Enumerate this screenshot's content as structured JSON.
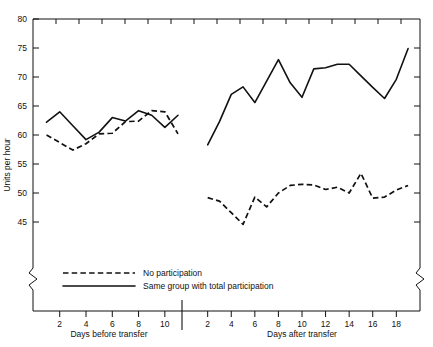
{
  "chart_data": {
    "type": "line",
    "title": "",
    "subtitle": "",
    "ylabel": "Units per hour",
    "ylim": [
      43,
      80
    ],
    "yticks": [
      45,
      50,
      55,
      60,
      65,
      70,
      75,
      80
    ],
    "grid": false,
    "legend_position": "inside-bottom-left",
    "axis_break": "y-axis broken below 45",
    "panels": [
      {
        "name": "before",
        "xlabel": "Days before transfer",
        "xticks": [
          2,
          4,
          6,
          8,
          10
        ],
        "xlim": [
          0.5,
          11
        ],
        "series": [
          {
            "name": "No participation",
            "style": "dashed",
            "x": [
              1,
              2,
              3,
              4,
              5,
              6,
              7,
              8,
              9,
              10,
              11
            ],
            "values": [
              60.0,
              58.7,
              57.4,
              58.5,
              60.2,
              60.3,
              62.3,
              62.4,
              64.2,
              64.0,
              60.2
            ]
          },
          {
            "name": "Same group with total participation",
            "style": "solid",
            "x": [
              1,
              2,
              3,
              4,
              5,
              6,
              7,
              8,
              9,
              10,
              11
            ],
            "values": [
              62.2,
              64.0,
              61.6,
              59.2,
              60.5,
              63.0,
              62.4,
              64.2,
              63.4,
              61.3,
              63.4
            ]
          }
        ]
      },
      {
        "name": "after",
        "xlabel": "Days after transfer",
        "xticks": [
          2,
          4,
          6,
          8,
          10,
          12,
          14,
          16,
          18
        ],
        "xlim": [
          0.5,
          19.5
        ],
        "series": [
          {
            "name": "No participation",
            "style": "dashed",
            "x": [
              2,
              3,
              4,
              5,
              6,
              7,
              8,
              9,
              10,
              11,
              12,
              13,
              14,
              15,
              16,
              17,
              18,
              19
            ],
            "values": [
              49.2,
              48.6,
              46.6,
              44.6,
              49.3,
              47.6,
              50.0,
              51.3,
              51.5,
              51.4,
              50.6,
              51.0,
              50.0,
              53.4,
              49.1,
              49.3,
              50.5,
              51.3
            ]
          },
          {
            "name": "Same group with total participation",
            "style": "solid",
            "x": [
              2,
              3,
              4,
              5,
              6,
              7,
              8,
              9,
              10,
              11,
              12,
              13,
              14,
              15,
              16,
              17,
              18,
              19
            ],
            "values": [
              58.3,
              62.3,
              67.0,
              68.3,
              65.6,
              69.3,
              73.0,
              69.0,
              66.5,
              71.4,
              71.6,
              72.2,
              72.2,
              70.2,
              68.2,
              66.3,
              69.6,
              74.9
            ]
          }
        ]
      }
    ],
    "legend": [
      {
        "label": "No participation",
        "style": "dashed"
      },
      {
        "label": "Same group with total participation",
        "style": "solid"
      }
    ]
  },
  "axis": {
    "ylabel": "Units per hour",
    "yticks": [
      "80",
      "75",
      "70",
      "65",
      "60",
      "55",
      "50",
      "45"
    ],
    "left_panel": {
      "xlabel": "Days before transfer",
      "xticks": [
        "2",
        "4",
        "6",
        "8",
        "10"
      ]
    },
    "right_panel": {
      "xlabel": "Days after transfer",
      "xticks": [
        "2",
        "4",
        "6",
        "8",
        "10",
        "12",
        "14",
        "16",
        "18"
      ]
    }
  },
  "legend": {
    "items": [
      {
        "label": "No participation"
      },
      {
        "label": "Same group with total participation"
      }
    ]
  },
  "colors": {
    "ink": "#111111",
    "background": "#ffffff"
  }
}
